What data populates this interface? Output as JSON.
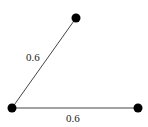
{
  "diagram": {
    "type": "graph",
    "nodes": [
      {
        "id": "top",
        "x": 76,
        "y": 18
      },
      {
        "id": "bottom-left",
        "x": 12,
        "y": 108
      },
      {
        "id": "bottom-right",
        "x": 138,
        "y": 108
      }
    ],
    "edges": [
      {
        "from": "bottom-left",
        "to": "top",
        "label": "0.6"
      },
      {
        "from": "bottom-left",
        "to": "bottom-right",
        "label": "0.6"
      }
    ]
  }
}
